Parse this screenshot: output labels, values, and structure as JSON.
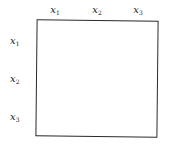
{
  "diagram": {
    "type": "matrix-grid",
    "column_labels": [
      {
        "var": "x",
        "sub": "1"
      },
      {
        "var": "x",
        "sub": "2"
      },
      {
        "var": "x",
        "sub": "3"
      }
    ],
    "row_labels": [
      {
        "var": "x",
        "sub": "1"
      },
      {
        "var": "x",
        "sub": "2"
      },
      {
        "var": "x",
        "sub": "3"
      }
    ],
    "colors": {
      "border": "#2a2a2a",
      "text": "#222222",
      "background": "#ffffff"
    }
  }
}
